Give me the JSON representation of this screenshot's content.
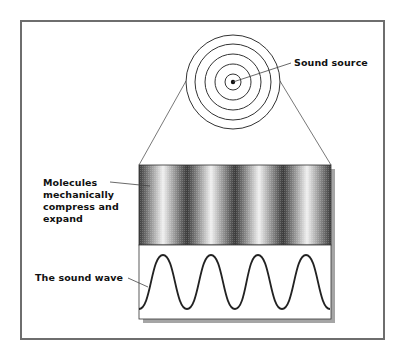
{
  "diagram": {
    "labels": {
      "sound_source": "Sound source",
      "molecules": "Molecules mechanically compress and expand",
      "sound_wave": "The sound wave"
    },
    "source": {
      "center": [
        233,
        82
      ],
      "ring_radii": [
        47,
        38,
        28,
        18,
        8
      ],
      "dot_radius": 2
    },
    "compression_band": {
      "x": 139,
      "y": 165,
      "width": 192,
      "height": 80,
      "dark_band_x": [
        139,
        187,
        235,
        282,
        330
      ],
      "light_band_x": [
        163,
        211,
        258,
        306
      ]
    },
    "wave": {
      "box": {
        "x": 139,
        "y": 245,
        "width": 192,
        "height": 74
      },
      "peak_y": 255,
      "trough_y": 309,
      "peak_x": [
        163,
        211,
        258,
        306
      ],
      "period_px": 47.7
    },
    "colors": {
      "stroke": "#333333",
      "frame": "#6e6e6e",
      "shadow": "#9a9a9a",
      "dark_band": "#3a3a3a",
      "light_band": "#f2f2f2"
    }
  }
}
